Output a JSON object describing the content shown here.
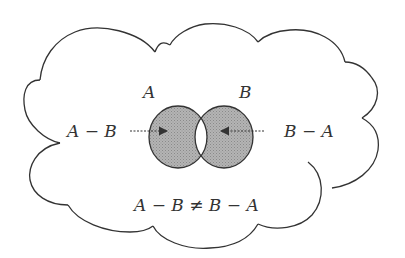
{
  "diagram": {
    "type": "venn-difference",
    "labels": {
      "set_a": "A",
      "set_b": "B",
      "a_minus_b": "A − B",
      "b_minus_a": "B − A",
      "inequality": "A − B ≠ B − A"
    },
    "colors": {
      "outline": "#333333",
      "shaded_region": "#a8a8a8",
      "intersection": "#ffffff",
      "background": "#ffffff"
    },
    "elements": {
      "universe_shape": "cloud",
      "arrow_left": "dashed arrow pointing from 'A − B' label into A-only region",
      "arrow_right": "dashed arrow pointing from 'B − A' label into B-only region"
    }
  }
}
